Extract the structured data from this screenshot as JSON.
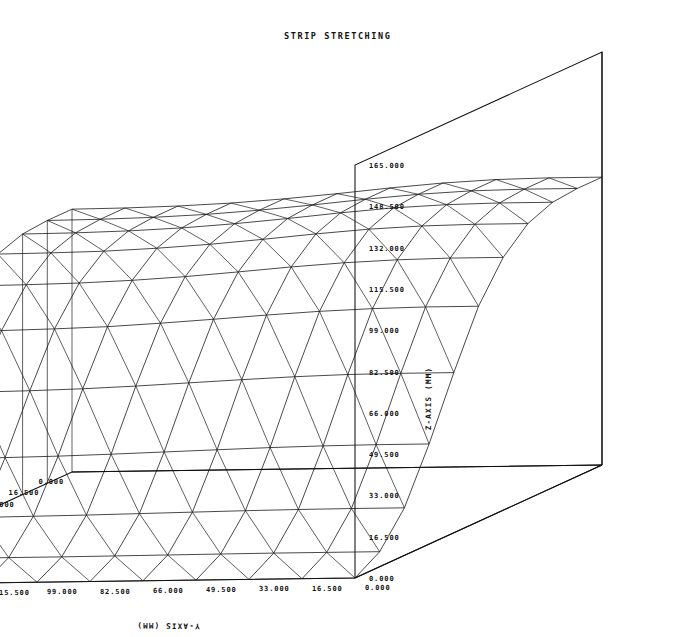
{
  "figure": {
    "title": "STRIP STRETCHING",
    "background_color": "#ffffff",
    "line_color": "#111111",
    "render_style": "wireframe-triangulated"
  },
  "axes": {
    "x": {
      "label": "X-AXIS (MM)",
      "unit": "MM",
      "min": 0.0,
      "max": 165.0,
      "step": 16.5,
      "ticks": [
        "0.000",
        "16.500",
        "33.000",
        "49.500",
        "66.000",
        "82.500",
        "99.000",
        "115.500",
        "132.000",
        "148.500",
        "165.000"
      ]
    },
    "y": {
      "label": "Y-AXIS (MM)",
      "unit": "MM",
      "min": 0.0,
      "max": 165.0,
      "step": 16.5,
      "ticks": [
        "0.000",
        "16.500",
        "33.000",
        "49.500",
        "66.000",
        "82.500",
        "99.000",
        "115.500",
        "132.000",
        "148.500",
        "165.000"
      ]
    },
    "z": {
      "label": "Z-AXIS (MM)",
      "unit": "MM",
      "min": 0.0,
      "max": 165.0,
      "step": 16.5,
      "ticks": [
        "0.000",
        "16.500",
        "33.000",
        "49.500",
        "66.000",
        "82.500",
        "99.000",
        "115.500",
        "132.000",
        "148.500",
        "165.000"
      ]
    }
  },
  "chart_data": {
    "type": "surface",
    "title": "STRIP STRETCHING",
    "xlabel": "X-AXIS (MM)",
    "ylabel": "Y-AXIS (MM)",
    "zlabel": "Z-AXIS (MM)",
    "xlim": [
      0,
      165
    ],
    "ylim": [
      0,
      165
    ],
    "zlim": [
      0,
      165
    ],
    "grid": false,
    "legend": "none",
    "mesh": {
      "nx": 11,
      "ny": 11,
      "triangulated": true
    },
    "x": [
      0,
      16.5,
      33,
      49.5,
      66,
      82.5,
      99,
      115.5,
      132,
      148.5,
      165
    ],
    "y": [
      0,
      16.5,
      33,
      49.5,
      66,
      82.5,
      99,
      115.5,
      132,
      148.5,
      165
    ],
    "z_rows": [
      [
        115.0,
        115.0,
        114.0,
        110.0,
        101.0,
        86.0,
        64.0,
        40.0,
        19.0,
        6.0,
        0.0
      ],
      [
        115.0,
        115.0,
        114.0,
        110.0,
        101.0,
        86.0,
        64.0,
        40.0,
        19.0,
        6.0,
        0.0
      ],
      [
        114.6,
        114.6,
        113.6,
        109.6,
        100.6,
        85.6,
        63.8,
        39.8,
        18.9,
        6.0,
        0.0
      ],
      [
        113.5,
        113.5,
        112.6,
        108.6,
        99.7,
        84.8,
        63.2,
        39.4,
        18.7,
        5.9,
        0.0
      ],
      [
        111.8,
        111.8,
        110.9,
        107.0,
        98.3,
        83.6,
        62.3,
        38.8,
        18.4,
        5.8,
        0.0
      ],
      [
        109.8,
        109.8,
        108.9,
        105.1,
        96.6,
        82.2,
        61.3,
        38.2,
        18.1,
        5.7,
        0.0
      ],
      [
        108.0,
        108.0,
        107.1,
        103.4,
        95.0,
        80.9,
        60.3,
        37.6,
        17.8,
        5.6,
        0.0
      ],
      [
        106.6,
        106.6,
        105.7,
        102.1,
        93.8,
        79.8,
        59.5,
        37.1,
        17.6,
        5.6,
        0.0
      ],
      [
        105.7,
        105.7,
        104.8,
        101.2,
        93.0,
        79.2,
        59.0,
        36.8,
        17.4,
        5.5,
        0.0
      ],
      [
        105.2,
        105.2,
        104.3,
        100.8,
        92.6,
        78.8,
        58.7,
        36.6,
        17.3,
        5.5,
        0.0
      ],
      [
        105.0,
        105.0,
        104.1,
        100.6,
        92.4,
        78.7,
        58.6,
        36.5,
        17.3,
        5.5,
        0.0
      ]
    ]
  },
  "projection": {
    "origin_px": [
      602,
      465
    ],
    "x_axis_end_px": [
      355,
      578
    ],
    "y_axis_end_px": [
      72,
      472
    ],
    "z_height_px": 413
  }
}
